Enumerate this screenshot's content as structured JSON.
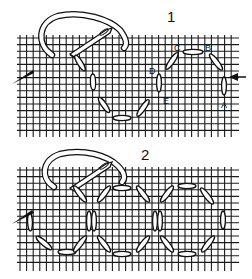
{
  "figure": {
    "colors": {
      "ink": "#111111",
      "paper": "#ffffff",
      "grid": "#1a1a1a"
    },
    "panels": [
      {
        "number": "1",
        "labels": [
          "A",
          "B",
          "C",
          "D",
          "E"
        ],
        "description": "Single ring of straight stitches worked on canvas grid, starting at arrow near A, going up through B, C, D, E."
      },
      {
        "number": "2",
        "description": "Interlocking rings of straight stitches forming a chain across the canvas grid."
      }
    ],
    "icons": [
      "needle-with-thread-icon",
      "needle-tip-icon",
      "start-arrow-icon"
    ]
  }
}
